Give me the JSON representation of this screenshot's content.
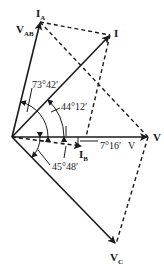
{
  "diagram": {
    "type": "phasor-diagram",
    "colors": {
      "stroke": "#1a1a1a",
      "background": "#ffffff"
    },
    "origin": {
      "x": 12,
      "y": 137
    },
    "phasors": [
      {
        "id": "IA",
        "main": "I",
        "sub": "A",
        "x2": 40,
        "y2": 22,
        "style": "solid"
      },
      {
        "id": "VAB",
        "main": "V",
        "sub": "AB",
        "x2": 40,
        "y2": 22,
        "style": "solid"
      },
      {
        "id": "I",
        "main": "I",
        "sub": "",
        "x2": 110,
        "y2": 35,
        "style": "solid"
      },
      {
        "id": "V",
        "main": "V",
        "sub": "",
        "x2": 148,
        "y2": 137,
        "style": "solid"
      },
      {
        "id": "IB",
        "main": "I",
        "sub": "B",
        "x2": 82,
        "y2": 146,
        "style": "dashed"
      },
      {
        "id": "VC",
        "main": "V",
        "sub": "C",
        "x2": 116,
        "y2": 244,
        "style": "solid"
      }
    ],
    "labels": {
      "IA": {
        "main": "I",
        "sub": "A"
      },
      "VAB": {
        "main": "V",
        "sub": "AB"
      },
      "I": {
        "main": "I"
      },
      "V": {
        "main": "V"
      },
      "IB": {
        "main": "I",
        "sub": "B"
      },
      "VC": {
        "main": "V",
        "sub": "C"
      },
      "V2": {
        "main": "V"
      }
    },
    "angles": {
      "a1": "73°42′",
      "a2": "44°12′",
      "a3": "7°16′",
      "a4": "45°48′"
    }
  }
}
